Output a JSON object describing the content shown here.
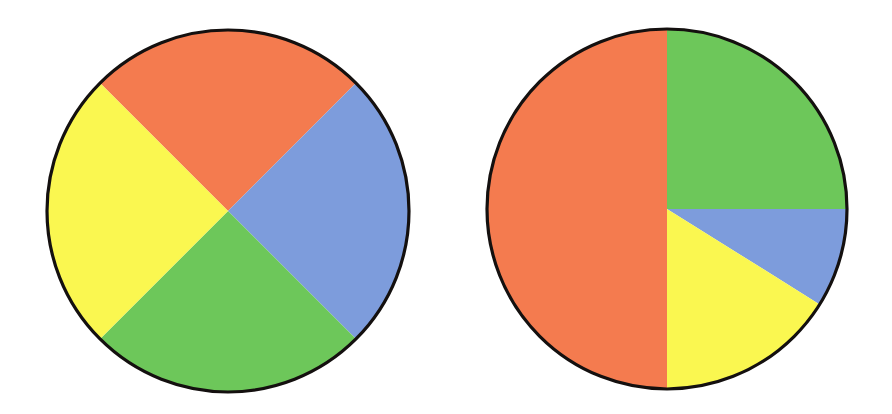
{
  "figure": {
    "title": "Two pie charts",
    "background_color": "#ffffff",
    "outline_color": "#14100f",
    "width": 892,
    "height": 414
  },
  "palette": {
    "orange": "#F47B4F",
    "yellow": "#FAF750",
    "green": "#6DC75A",
    "blue": "#7D9CDC"
  },
  "chart_data": [
    {
      "type": "pie",
      "title": "Left pie chart",
      "center": [
        228,
        211
      ],
      "radius": 181,
      "start_angle_deg": 45,
      "direction": "clockwise",
      "grid": false,
      "legend": "none",
      "labels": [
        "Orange",
        "Blue",
        "Green",
        "Yellow"
      ],
      "values": [
        25,
        25,
        25,
        25
      ],
      "slices": [
        {
          "label": "Orange",
          "value": 25,
          "color": "#F47B4F",
          "start_deg": 315,
          "end_deg": 45
        },
        {
          "label": "Blue",
          "value": 25,
          "color": "#7D9CDC",
          "start_deg": 45,
          "end_deg": 135
        },
        {
          "label": "Green",
          "value": 25,
          "color": "#6DC75A",
          "start_deg": 135,
          "end_deg": 225
        },
        {
          "label": "Yellow",
          "value": 25,
          "color": "#FAF750",
          "start_deg": 225,
          "end_deg": 315
        }
      ]
    },
    {
      "type": "pie",
      "title": "Right pie chart",
      "center": [
        667,
        209
      ],
      "radius": 180,
      "start_angle_deg": 0,
      "direction": "clockwise",
      "grid": false,
      "legend": "none",
      "labels": [
        "Green",
        "Blue",
        "Yellow",
        "Orange"
      ],
      "values": [
        25,
        9,
        16,
        50
      ],
      "slices": [
        {
          "label": "Green",
          "value": 25,
          "color": "#6DC75A",
          "start_deg": 0,
          "end_deg": 90
        },
        {
          "label": "Blue",
          "value": 9,
          "color": "#7D9CDC",
          "start_deg": 90,
          "end_deg": 122
        },
        {
          "label": "Yellow",
          "value": 16,
          "color": "#FAF750",
          "start_deg": 122,
          "end_deg": 180
        },
        {
          "label": "Orange",
          "value": 50,
          "color": "#F47B4F",
          "start_deg": 180,
          "end_deg": 360
        }
      ]
    }
  ]
}
